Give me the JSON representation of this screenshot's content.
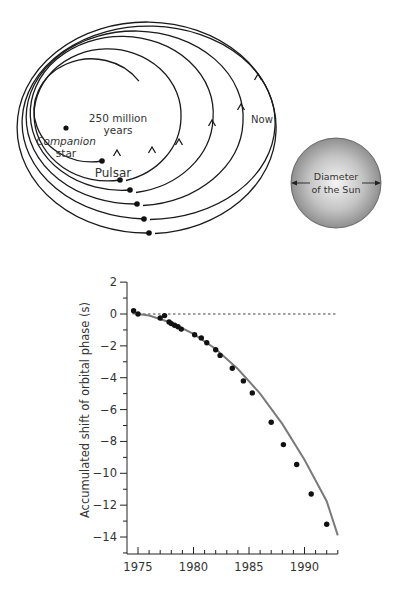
{
  "orbit_diagram": {
    "labels": {
      "companion": [
        "Companion",
        "star"
      ],
      "time": [
        "250 million",
        "years"
      ],
      "pulsar": "Pulsar",
      "now": "Now",
      "sun": [
        "Diameter",
        "of the Sun"
      ]
    },
    "colors": {
      "line": "#1a1a1a",
      "sun_center": "#f2f2f2",
      "sun_edge": "#8a8a8a"
    },
    "companion_star": {
      "cx": 66,
      "cy": 128
    },
    "orbits": [
      {
        "left": 40,
        "right": 155,
        "top": 58,
        "bottom": 161,
        "dot": [
          102,
          161
        ],
        "arrow": [
          117,
          150
        ],
        "partial": true
      },
      {
        "left": 34,
        "right": 181,
        "top": 48,
        "bottom": 180,
        "dot": [
          120,
          180
        ],
        "arrow": [
          152,
          147
        ]
      },
      {
        "left": 30,
        "right": 213,
        "top": 38,
        "bottom": 192,
        "dot": [
          130,
          190
        ],
        "arrow": [
          179,
          139
        ]
      },
      {
        "left": 26,
        "right": 243,
        "top": 32,
        "bottom": 205,
        "dot": [
          137,
          204
        ],
        "arrow": [
          212,
          120
        ]
      },
      {
        "left": 22,
        "right": 275,
        "top": 26,
        "bottom": 219,
        "dot": [
          144,
          219
        ],
        "arrow": [
          241,
          104
        ]
      },
      {
        "left": 17,
        "right": 276,
        "top": 22,
        "bottom": 233,
        "dot": [
          149,
          233
        ],
        "arrow": [
          258,
          74
        ],
        "now": true
      }
    ],
    "sun": {
      "cx": 336,
      "cy": 183,
      "r": 45
    }
  },
  "chart_data": {
    "type": "scatter",
    "title": "",
    "xlabel": "",
    "ylabel": "Accumulated shift of orbital phase (s)",
    "xlim": [
      1974,
      1993
    ],
    "ylim": [
      -15,
      2
    ],
    "x_ticks": [
      1975,
      1980,
      1985,
      1990
    ],
    "y_ticks": [
      2,
      0,
      -2,
      -4,
      -6,
      -8,
      -10,
      -12,
      -14
    ],
    "reference_line": {
      "y": 0,
      "style": "dashed",
      "x_range": [
        1975,
        1993
      ]
    },
    "series": [
      {
        "name": "Observed",
        "style": "points",
        "x": [
          1974.6,
          1975.0,
          1977.0,
          1977.4,
          1977.8,
          1978.0,
          1978.3,
          1978.6,
          1978.9,
          1980.1,
          1980.7,
          1981.2,
          1982.0,
          1982.4,
          1983.5,
          1984.5,
          1985.3,
          1987.0,
          1988.1,
          1989.3,
          1990.6,
          1992.0
        ],
        "y": [
          0.2,
          0.0,
          -0.25,
          -0.1,
          -0.5,
          -0.6,
          -0.7,
          -0.8,
          -0.95,
          -1.3,
          -1.5,
          -1.8,
          -2.25,
          -2.6,
          -3.4,
          -4.2,
          -4.95,
          -6.8,
          -8.2,
          -9.45,
          -11.3,
          -13.2
        ]
      },
      {
        "name": "General relativity prediction",
        "style": "line",
        "x": [
          1974.5,
          1976,
          1978,
          1980,
          1982,
          1984,
          1986,
          1988,
          1990,
          1992,
          1993
        ],
        "y": [
          0.05,
          -0.1,
          -0.55,
          -1.25,
          -2.2,
          -3.45,
          -5.0,
          -6.9,
          -9.15,
          -11.75,
          -13.9
        ]
      }
    ],
    "grid": false,
    "legend": null
  }
}
